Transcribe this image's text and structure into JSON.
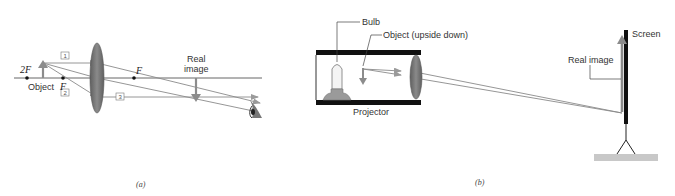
{
  "panel_a": {
    "caption": "(a)",
    "labels": {
      "two_f": "2F",
      "object": "Object",
      "f_left": "F",
      "f_right": "F",
      "real_image_line1": "Real",
      "real_image_line2": "image"
    },
    "ray_numbers": [
      "1",
      "2",
      "3"
    ],
    "icons": [
      "converging-lens-icon",
      "eye-icon",
      "object-arrow-icon",
      "image-arrow-icon"
    ]
  },
  "panel_b": {
    "caption": "(b)",
    "labels": {
      "bulb": "Bulb",
      "object": "Object (upside down)",
      "projector": "Projector",
      "screen": "Screen",
      "real_image": "Real image"
    },
    "icons": [
      "bulb-icon",
      "converging-lens-icon",
      "screen-stand-icon"
    ]
  },
  "colors": {
    "lens": "#7a7a7a",
    "ray": "#8a8a8a",
    "arrow": "#8c8c8c",
    "housing": "#111111",
    "ground": "#c8c8c8"
  }
}
